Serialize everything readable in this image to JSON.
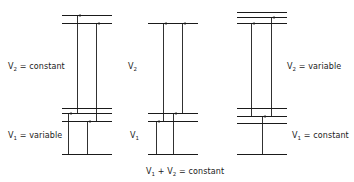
{
  "diagram": {
    "type": "energy-level diagram",
    "line_color": "#1a1a1a",
    "panels": [
      {
        "id": "panel-1",
        "x_range": [
          62,
          112
        ],
        "levels_y": [
          15,
          23,
          108,
          113,
          121,
          154
        ],
        "arrows": [
          {
            "x": 68,
            "from": 154,
            "to": 113
          },
          {
            "x": 77,
            "from": 113,
            "to": 15
          },
          {
            "x": 87,
            "from": 154,
            "to": 121
          },
          {
            "x": 96,
            "from": 121,
            "to": 23
          }
        ],
        "labels": {
          "upper": {
            "var": "V",
            "sub": "2",
            "text": " = constant"
          },
          "lower": {
            "var": "V",
            "sub": "1",
            "text": " = variable"
          }
        }
      },
      {
        "id": "panel-2",
        "x_range": [
          148,
          198
        ],
        "levels_y": [
          23,
          113,
          121,
          154
        ],
        "arrows": [
          {
            "x": 156,
            "from": 154,
            "to": 121
          },
          {
            "x": 163,
            "from": 121,
            "to": 23
          },
          {
            "x": 173,
            "from": 154,
            "to": 113
          },
          {
            "x": 182,
            "from": 113,
            "to": 23
          }
        ],
        "labels": {
          "upper": {
            "var": "V",
            "sub": "2",
            "text": ""
          },
          "lower": {
            "var": "V",
            "sub": "1",
            "text": ""
          },
          "bottom": {
            "var1": "V",
            "sub1": "1",
            "plus": " + ",
            "var2": "V",
            "sub2": "2",
            "text": " = constant"
          }
        }
      },
      {
        "id": "panel-3",
        "x_range": [
          237,
          287
        ],
        "levels_y": [
          12,
          17,
          23,
          108,
          116,
          123,
          154
        ],
        "arrows": [
          {
            "x": 262,
            "from": 154,
            "to": 116
          },
          {
            "x": 251,
            "from": 116,
            "to": 23
          },
          {
            "x": 271,
            "from": 116,
            "to": 17
          }
        ],
        "labels": {
          "upper": {
            "var": "V",
            "sub": "2",
            "text": " = variable"
          },
          "lower": {
            "var": "V",
            "sub": "1",
            "text": " = constant"
          }
        }
      }
    ]
  }
}
